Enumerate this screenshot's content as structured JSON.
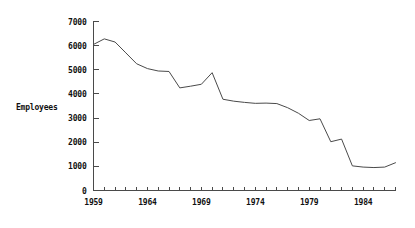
{
  "chart_data": {
    "type": "line",
    "title": "",
    "xlabel": "",
    "ylabel": "Employees",
    "xlim": [
      1959,
      1987
    ],
    "ylim": [
      0,
      7000
    ],
    "grid": false,
    "legend": null,
    "y_ticks": [
      0,
      1000,
      2000,
      3000,
      4000,
      5000,
      6000,
      7000
    ],
    "y_tick_labels": [
      "0",
      "1000",
      "2000",
      "3000",
      "4000",
      "5000",
      "6000",
      "7000"
    ],
    "x_ticks": [
      1959,
      1960,
      1961,
      1962,
      1963,
      1964,
      1965,
      1966,
      1967,
      1968,
      1969,
      1970,
      1971,
      1972,
      1973,
      1974,
      1975,
      1976,
      1977,
      1978,
      1979,
      1980,
      1981,
      1982,
      1983,
      1984,
      1985,
      1986,
      1987
    ],
    "x_tick_labels": [
      "1959",
      "",
      "",
      "",
      "",
      "1964",
      "",
      "",
      "",
      "",
      "1969",
      "",
      "",
      "",
      "",
      "1974",
      "",
      "",
      "",
      "",
      "1979",
      "",
      "",
      "",
      "",
      "1984",
      "",
      "",
      ""
    ],
    "x_labeled_ticks": [
      1959,
      1964,
      1969,
      1974,
      1979,
      1984
    ],
    "series": [
      {
        "name": "Employees",
        "color": "#4a4a4a",
        "x": [
          1959,
          1960,
          1961,
          1962,
          1963,
          1964,
          1965,
          1966,
          1967,
          1968,
          1969,
          1970,
          1971,
          1972,
          1973,
          1974,
          1975,
          1976,
          1977,
          1978,
          1979,
          1980,
          1981,
          1982,
          1983,
          1984,
          1985,
          1986,
          1987
        ],
        "values": [
          6050,
          6280,
          6150,
          5700,
          5250,
          5050,
          4950,
          4930,
          4250,
          4320,
          4400,
          4880,
          3780,
          3700,
          3650,
          3610,
          3620,
          3600,
          3430,
          3200,
          2900,
          2970,
          2020,
          2130,
          1020,
          970,
          950,
          970,
          1150
        ]
      }
    ]
  },
  "axis": {
    "y_axis_name": "y-axis",
    "x_axis_name": "x-axis"
  }
}
